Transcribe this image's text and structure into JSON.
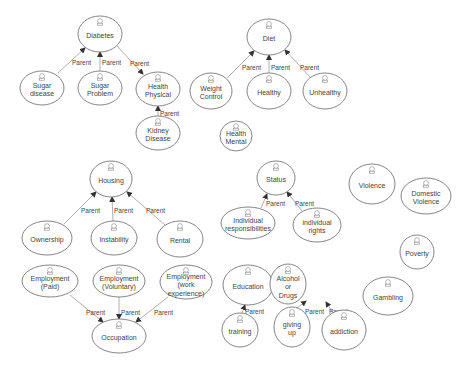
{
  "diagram": {
    "type": "use-case-hierarchy",
    "edge_label": "Parent",
    "colors": {
      "stroke": "#777777",
      "edge": "#999999",
      "text": "#444444",
      "background": "#ffffff"
    },
    "nodes": [
      {
        "id": "diabetes",
        "lines": [
          "Diabetes"
        ],
        "cx": 100,
        "cy": 34,
        "rx": 22,
        "ry": 18
      },
      {
        "id": "sugar-disease",
        "lines": [
          "Sugar",
          "disease"
        ],
        "cx": 42,
        "cy": 88,
        "rx": 22,
        "ry": 17
      },
      {
        "id": "sugar-problem",
        "lines": [
          "Sugar",
          "Problem"
        ],
        "cx": 100,
        "cy": 88,
        "rx": 22,
        "ry": 17
      },
      {
        "id": "health-physical",
        "lines": [
          "Health",
          "Physical"
        ],
        "cx": 158,
        "cy": 89,
        "rx": 22,
        "ry": 17
      },
      {
        "id": "kidney-disease",
        "lines": [
          "Kidney",
          "Disease"
        ],
        "cx": 158,
        "cy": 133,
        "rx": 22,
        "ry": 17
      },
      {
        "id": "diet",
        "lines": [
          "Diet"
        ],
        "cx": 269,
        "cy": 37,
        "rx": 22,
        "ry": 18
      },
      {
        "id": "weight-control",
        "lines": [
          "Weight",
          "Control"
        ],
        "cx": 211,
        "cy": 91,
        "rx": 21,
        "ry": 18
      },
      {
        "id": "healthy",
        "lines": [
          "Healthy"
        ],
        "cx": 269,
        "cy": 91,
        "rx": 22,
        "ry": 18
      },
      {
        "id": "unhealthy",
        "lines": [
          "Unhealthy"
        ],
        "cx": 325,
        "cy": 91,
        "rx": 22,
        "ry": 18
      },
      {
        "id": "health-mental",
        "lines": [
          "Health",
          "Mental"
        ],
        "cx": 236,
        "cy": 136,
        "rx": 16,
        "ry": 15
      },
      {
        "id": "housing",
        "lines": [
          "Housing"
        ],
        "cx": 111,
        "cy": 179,
        "rx": 21,
        "ry": 18
      },
      {
        "id": "ownership",
        "lines": [
          "Ownership"
        ],
        "cx": 47,
        "cy": 238,
        "rx": 25,
        "ry": 17
      },
      {
        "id": "instability",
        "lines": [
          "Instability"
        ],
        "cx": 114,
        "cy": 238,
        "rx": 23,
        "ry": 17
      },
      {
        "id": "rental",
        "lines": [
          "Rental"
        ],
        "cx": 180,
        "cy": 239,
        "rx": 23,
        "ry": 18
      },
      {
        "id": "employment-paid",
        "lines": [
          "Employment",
          "(Paid)"
        ],
        "cx": 50,
        "cy": 281,
        "rx": 28,
        "ry": 16
      },
      {
        "id": "employment-voluntary",
        "lines": [
          "Employment",
          "(Voluntary)"
        ],
        "cx": 119,
        "cy": 281,
        "rx": 26,
        "ry": 16
      },
      {
        "id": "employment-work-experience",
        "lines": [
          "Employment",
          "(work",
          "experience)"
        ],
        "cx": 186,
        "cy": 282,
        "rx": 26,
        "ry": 17
      },
      {
        "id": "occupation",
        "lines": [
          "Occupation"
        ],
        "cx": 119,
        "cy": 336,
        "rx": 27,
        "ry": 17
      },
      {
        "id": "status",
        "lines": [
          "Status"
        ],
        "cx": 276,
        "cy": 178,
        "rx": 19,
        "ry": 17
      },
      {
        "id": "individual-responsibilities",
        "lines": [
          "Individual",
          "responsibilities"
        ],
        "cx": 248,
        "cy": 223,
        "rx": 27,
        "ry": 16
      },
      {
        "id": "individual-rights",
        "lines": [
          "individual",
          "rights"
        ],
        "cx": 317,
        "cy": 225,
        "rx": 24,
        "ry": 17
      },
      {
        "id": "violence",
        "lines": [
          "Violence"
        ],
        "cx": 372,
        "cy": 184,
        "rx": 23,
        "ry": 20
      },
      {
        "id": "domestic-violence",
        "lines": [
          "Domestic",
          "Violence"
        ],
        "cx": 426,
        "cy": 196,
        "rx": 25,
        "ry": 18
      },
      {
        "id": "poverty",
        "lines": [
          "Poverty"
        ],
        "cx": 417,
        "cy": 252,
        "rx": 17,
        "ry": 17
      },
      {
        "id": "gambling",
        "lines": [
          "Gambling"
        ],
        "cx": 388,
        "cy": 296,
        "rx": 25,
        "ry": 19
      },
      {
        "id": "education",
        "lines": [
          "Education"
        ],
        "cx": 248,
        "cy": 285,
        "rx": 25,
        "ry": 20
      },
      {
        "id": "training",
        "lines": [
          "training"
        ],
        "cx": 240,
        "cy": 330,
        "rx": 18,
        "ry": 17
      },
      {
        "id": "alcohol-or-drugs",
        "lines": [
          "Alcohol",
          "or",
          "Drugs"
        ],
        "cx": 288,
        "cy": 284,
        "rx": 18,
        "ry": 20
      },
      {
        "id": "giving-up",
        "lines": [
          "giving",
          "up"
        ],
        "cx": 292,
        "cy": 327,
        "rx": 18,
        "ry": 20
      },
      {
        "id": "addiction",
        "lines": [
          "addiction"
        ],
        "cx": 344,
        "cy": 330,
        "rx": 22,
        "ry": 20
      }
    ],
    "edges": [
      {
        "from": "sugar-disease",
        "to": "diabetes",
        "label": "Parent",
        "x1": 58,
        "y1": 73,
        "x2": 85,
        "y2": 48,
        "lx": 72,
        "ly": 65
      },
      {
        "from": "sugar-problem",
        "to": "diabetes",
        "label": "Parent",
        "x1": 100,
        "y1": 71,
        "x2": 100,
        "y2": 52,
        "lx": 102,
        "ly": 65
      },
      {
        "from": "diabetes",
        "to": "health-physical",
        "label": "Parent",
        "x1": 117,
        "y1": 46,
        "x2": 143,
        "y2": 74,
        "lx": 130,
        "ly": 66
      },
      {
        "from": "kidney-disease",
        "to": "health-physical",
        "label": "Parent",
        "x1": 158,
        "y1": 116,
        "x2": 158,
        "y2": 106,
        "lx": 160,
        "ly": 116
      },
      {
        "from": "weight-control",
        "to": "diet",
        "label": "Parent",
        "x1": 227,
        "y1": 78,
        "x2": 254,
        "y2": 51,
        "lx": 242,
        "ly": 70
      },
      {
        "from": "healthy",
        "to": "diet",
        "label": "Parent",
        "x1": 269,
        "y1": 73,
        "x2": 269,
        "y2": 55,
        "lx": 271,
        "ly": 70
      },
      {
        "from": "unhealthy",
        "to": "diet",
        "label": "Parent",
        "x1": 310,
        "y1": 77,
        "x2": 285,
        "y2": 50,
        "lx": 300,
        "ly": 70
      },
      {
        "from": "ownership",
        "to": "housing",
        "label": "Parent",
        "x1": 64,
        "y1": 224,
        "x2": 96,
        "y2": 192,
        "lx": 81,
        "ly": 213
      },
      {
        "from": "instability",
        "to": "housing",
        "label": "Parent",
        "x1": 113,
        "y1": 221,
        "x2": 112,
        "y2": 197,
        "lx": 114,
        "ly": 213
      },
      {
        "from": "rental",
        "to": "housing",
        "label": "Parent",
        "x1": 165,
        "y1": 225,
        "x2": 127,
        "y2": 192,
        "lx": 146,
        "ly": 213
      },
      {
        "from": "employment-paid",
        "to": "occupation",
        "label": "Parent",
        "x1": 70,
        "y1": 295,
        "x2": 103,
        "y2": 322,
        "lx": 86,
        "ly": 315
      },
      {
        "from": "employment-voluntary",
        "to": "occupation",
        "label": "Parent",
        "x1": 119,
        "y1": 297,
        "x2": 119,
        "y2": 319,
        "lx": 121,
        "ly": 315
      },
      {
        "from": "employment-work-experience",
        "to": "occupation",
        "label": "Parent",
        "x1": 168,
        "y1": 297,
        "x2": 136,
        "y2": 322,
        "lx": 154,
        "ly": 315
      },
      {
        "from": "individual-responsibilities",
        "to": "status",
        "label": "Parent",
        "x1": 261,
        "y1": 208,
        "x2": 267,
        "y2": 194,
        "lx": 266,
        "ly": 206
      },
      {
        "from": "individual-rights",
        "to": "status",
        "label": "Parent",
        "x1": 302,
        "y1": 211,
        "x2": 287,
        "y2": 192,
        "lx": 295,
        "ly": 206
      },
      {
        "from": "training",
        "to": "education",
        "label": "Parent",
        "x1": 242,
        "y1": 313,
        "x2": 245,
        "y2": 305,
        "lx": 245,
        "ly": 314
      },
      {
        "from": "giving-up",
        "to": "alcohol-or-drugs",
        "label": "Parent",
        "x1": 297,
        "y1": 308,
        "x2": 306,
        "y2": 301,
        "lx": 305,
        "ly": 314
      },
      {
        "from": "addiction",
        "to": "alcohol-or-drugs",
        "label": "Parent",
        "x1": 333,
        "y1": 313,
        "x2": 326,
        "y2": 302,
        "lx": 329,
        "ly": 314
      }
    ]
  }
}
